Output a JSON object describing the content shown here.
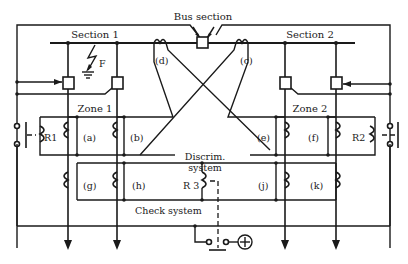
{
  "diagram": {
    "title": "Bus section",
    "sections": [
      {
        "id": "section-1",
        "label": "Section 1"
      },
      {
        "id": "section-2",
        "label": "Section 2"
      }
    ],
    "zones": [
      {
        "id": "zone-1",
        "label": "Zone 1"
      },
      {
        "id": "zone-2",
        "label": "Zone 2"
      }
    ],
    "fault_label": "F",
    "current_transformers": {
      "a": "(a)",
      "b": "(b)",
      "c": "(c)",
      "d": "(d)",
      "e": "(e)",
      "f": "(f)",
      "g": "(g)",
      "h": "(h)",
      "j": "(j)",
      "k": "(k)"
    },
    "relays": {
      "r1": "R1",
      "r2": "R2",
      "r3": "R 3"
    },
    "systems": {
      "discrim_line1": "Discrim.",
      "discrim_line2": "system",
      "check": "Check system"
    },
    "supply_symbol": "⊕"
  }
}
